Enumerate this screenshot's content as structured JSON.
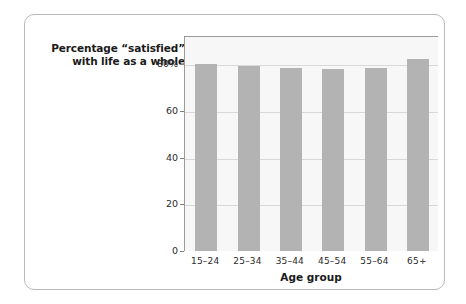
{
  "chart_data": {
    "type": "bar",
    "title": "Percentage “satisfied” with life as a whole",
    "title_lines": [
      "Percentage “satisfied”",
      "with life as a whole"
    ],
    "xlabel": "Age group",
    "ylabel": "",
    "categories": [
      "15–24",
      "25–34",
      "35–44",
      "45–54",
      "55–64",
      "65+"
    ],
    "values": [
      80,
      79,
      78.5,
      78,
      78.5,
      82
    ],
    "ylim": [
      0,
      92
    ],
    "yticks": [
      0,
      20,
      40,
      60,
      80
    ],
    "ytick_labels": [
      "0",
      "20",
      "40",
      "60",
      "80%"
    ],
    "grid": true,
    "legend": "none",
    "bar_color": "#b3b3b3",
    "plot_background": "#f7f7f7",
    "axis_color": "#9a9a9a",
    "gridline_color": "#d8d8d8",
    "card_border_color": "#b9b9b9",
    "text_color": "#1a1a1a"
  }
}
